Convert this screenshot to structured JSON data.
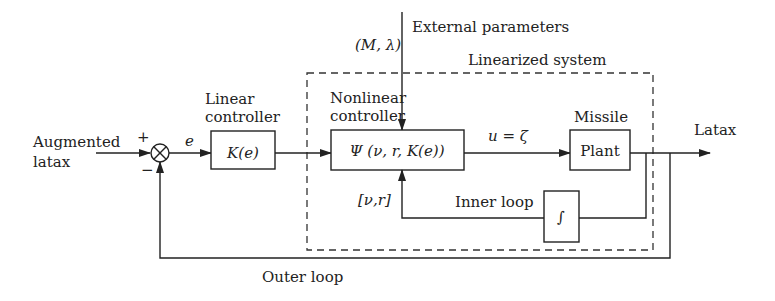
{
  "diagram": {
    "type": "control-system block diagram",
    "labels": {
      "input_line1": "Augmented",
      "input_line2": "latax",
      "plus_sign": "+",
      "minus_sign": "−",
      "error_signal": "e",
      "linear_controller_line1": "Linear",
      "linear_controller_line2": "controller",
      "nonlinear_controller_line1": "Nonlinear",
      "nonlinear_controller_line2": "controller",
      "external_parameters": "External parameters",
      "external_params_symbol": "(M, λ)",
      "linearized_system": "Linearized system",
      "control_signal": "u = ζ",
      "missile": "Missile",
      "output": "Latax",
      "feedback_states": "[ν,r]",
      "inner_loop": "Inner loop",
      "outer_loop": "Outer loop"
    },
    "blocks": {
      "linear_controller": "K(e)",
      "nonlinear_controller": "Ψ (ν, r, K(e))",
      "plant": "Plant",
      "integrator": "∫"
    },
    "colors": {
      "stroke": "#222222",
      "background": "#ffffff"
    }
  }
}
